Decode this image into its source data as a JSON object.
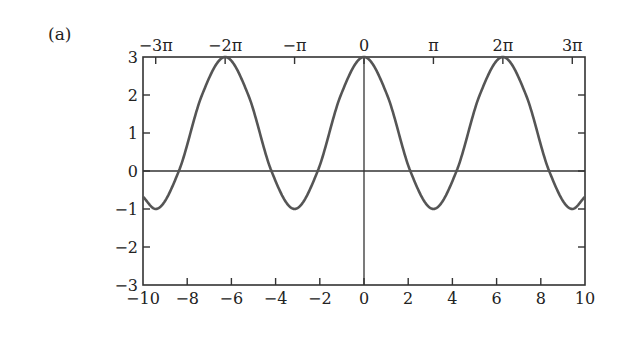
{
  "panel_label": "(a)",
  "chart_data": {
    "type": "line",
    "title": "",
    "function": "1 + 2cos(x)",
    "xlabel": "",
    "ylabel": "",
    "xlim": [
      -10,
      10
    ],
    "ylim": [
      -3,
      3
    ],
    "grid": false,
    "legend": null,
    "x_ticks_bottom": [
      -10,
      -8,
      -6,
      -4,
      -2,
      0,
      2,
      4,
      6,
      8,
      10
    ],
    "x_tick_labels_bottom": [
      "−10",
      "−8",
      "−6",
      "−4",
      "−2",
      "0",
      "2",
      "4",
      "6",
      "8",
      "10"
    ],
    "x_ticks_top": [
      -9.4248,
      -6.2832,
      -3.1416,
      0,
      3.1416,
      6.2832,
      9.4248
    ],
    "x_tick_labels_top": [
      "−3π",
      "−2π",
      "−π",
      "0",
      "π",
      "2π",
      "3π"
    ],
    "y_ticks": [
      -3,
      -2,
      -1,
      0,
      1,
      2,
      3
    ],
    "y_tick_labels": [
      "−3",
      "−2",
      "−1",
      "0",
      "1",
      "2",
      "3"
    ],
    "reference_lines": [
      {
        "orientation": "horizontal",
        "y": 0
      },
      {
        "orientation": "vertical",
        "x": 0
      }
    ],
    "series": [
      {
        "name": "f(x)",
        "color": "#555555",
        "x": [
          -10,
          -9.4248,
          -8.3776,
          -7.3304,
          -6.2832,
          -5.236,
          -4.1888,
          -3.1416,
          -2.0944,
          -1.0472,
          0,
          1.0472,
          2.0944,
          3.1416,
          4.1888,
          5.236,
          6.2832,
          7.3304,
          8.3776,
          9.4248,
          10
        ],
        "y": [
          -0.678,
          -1,
          0,
          2,
          3,
          2,
          0,
          -1,
          0,
          2,
          3,
          2,
          0,
          -1,
          0,
          2,
          3,
          2,
          0,
          -1,
          -0.678
        ]
      }
    ],
    "key_points": {
      "maxima": [
        {
          "x": -6.2832,
          "y": 3
        },
        {
          "x": 0,
          "y": 3
        },
        {
          "x": 6.2832,
          "y": 3
        }
      ],
      "minima": [
        {
          "x": -9.4248,
          "y": -1
        },
        {
          "x": -3.1416,
          "y": -1
        },
        {
          "x": 3.1416,
          "y": -1
        },
        {
          "x": 9.4248,
          "y": -1
        }
      ],
      "zeros": [
        -8.3776,
        -4.1888,
        -2.0944,
        2.0944,
        4.1888,
        8.3776
      ]
    }
  }
}
